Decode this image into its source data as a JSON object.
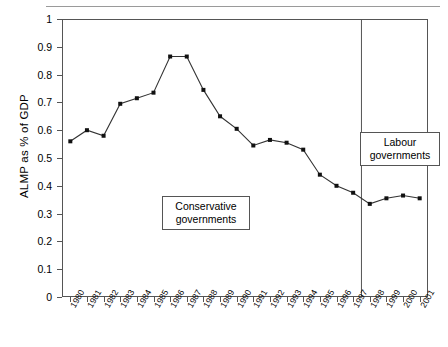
{
  "chart_data": {
    "type": "line",
    "title": "",
    "xlabel": "",
    "ylabel": "ALMP as % of GDP",
    "ylim": [
      0,
      1
    ],
    "xlim": [
      "1980",
      "2001"
    ],
    "grid": false,
    "legend": "none",
    "marker": "filled-square",
    "line_color": "#333333",
    "categories": [
      "1980",
      "1981",
      "1982",
      "1983",
      "1984",
      "1985",
      "1986",
      "1987",
      "1988",
      "1989",
      "1990",
      "1991",
      "1992",
      "1993",
      "1994",
      "1995",
      "1996",
      "1997",
      "1998",
      "1999",
      "2000",
      "2001"
    ],
    "values": [
      0.56,
      0.6,
      0.58,
      0.695,
      0.715,
      0.735,
      0.865,
      0.865,
      0.745,
      0.65,
      0.605,
      0.545,
      0.565,
      0.555,
      0.53,
      0.44,
      0.4,
      0.375,
      0.335,
      0.355,
      0.365,
      0.355
    ],
    "ytick_labels": [
      "0",
      "0.1",
      "0.2",
      "0.3",
      "0.4",
      "0.5",
      "0.6",
      "0.7",
      "0.8",
      "0.9",
      "1"
    ],
    "ytick_values": [
      0,
      0.1,
      0.2,
      0.3,
      0.4,
      0.5,
      0.6,
      0.7,
      0.8,
      0.9,
      1
    ],
    "annotations": [
      {
        "id": "conservative",
        "text_line1": "Conservative",
        "text_line2": "governments",
        "boxed": true
      },
      {
        "id": "labour",
        "text_line1": "Labour",
        "text_line2": "governments",
        "boxed": true
      }
    ],
    "divider": {
      "id": "government-change-1997",
      "at_x": "1997.5",
      "label": ""
    }
  },
  "figure": {
    "background": "#ffffff",
    "frame_color": "#555555",
    "top_rule_color": "#9a9a9a"
  }
}
